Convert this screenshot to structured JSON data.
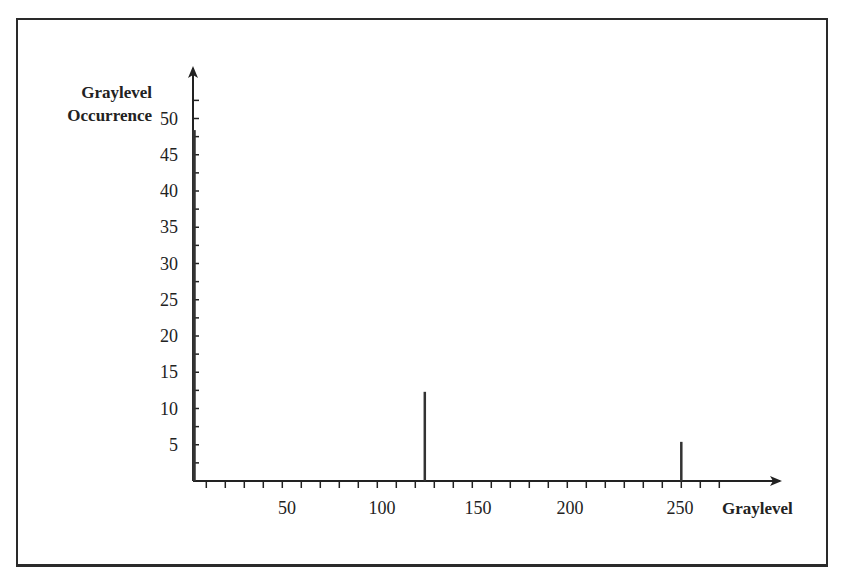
{
  "chart_data": {
    "type": "bar",
    "title": "",
    "xlabel": "Graylevel",
    "ylabel": [
      "Graylevel",
      "Occurrence"
    ],
    "x": [
      0,
      122,
      257
    ],
    "values": [
      48.4,
      12.3,
      5.4
    ],
    "x_tick_labels": [
      "50",
      "100",
      "150",
      "200",
      "250"
    ],
    "x_tick_values": [
      50,
      100,
      150,
      200,
      250
    ],
    "y_tick_labels": [
      "5",
      "10",
      "15",
      "20",
      "25",
      "30",
      "35",
      "40",
      "45",
      "50"
    ],
    "y_tick_values": [
      5,
      10,
      15,
      20,
      25,
      30,
      35,
      40,
      45,
      50
    ],
    "xlim": [
      0,
      290
    ],
    "ylim": [
      0,
      55
    ],
    "grid": false,
    "legend": null,
    "bar_color": "#333333",
    "axis_color": "#222222"
  }
}
